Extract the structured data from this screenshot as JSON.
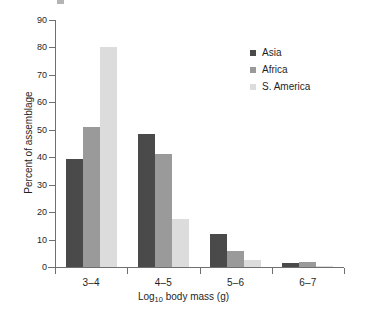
{
  "chart_data": {
    "type": "bar",
    "title": "",
    "subtitle": "",
    "xlabel_text": "Log10 body mass (g)",
    "xlabel_base": "Log",
    "xlabel_sub": "10",
    "xlabel_rest": " body mass (g)",
    "ylabel": "Percent of assemblage",
    "categories": [
      "3–4",
      "4–5",
      "5–6",
      "6–7"
    ],
    "series": [
      {
        "name": "Asia",
        "color": "#4a4a4a",
        "values": [
          39.5,
          48.5,
          12.0,
          1.5
        ]
      },
      {
        "name": "Africa",
        "color": "#9a9a9a",
        "values": [
          51.0,
          41.0,
          6.0,
          2.0
        ]
      },
      {
        "name": "S. America",
        "color": "#dcdcdc",
        "values": [
          80.0,
          17.5,
          2.5,
          0.3
        ]
      }
    ],
    "ylim": [
      0,
      90
    ],
    "ytick_step": 10,
    "yticks": [
      0,
      10,
      20,
      30,
      40,
      50,
      60,
      70,
      80,
      90
    ],
    "ytick_labels": [
      "0",
      "10",
      "20",
      "30",
      "40",
      "50",
      "60",
      "70",
      "80",
      "90"
    ],
    "grid": false,
    "legend_position": "top-right",
    "axis_color": "#6f6f6f",
    "text_color": "#1f1f1f",
    "background": "#ffffff"
  },
  "legend": {
    "entries": [
      {
        "label": "Asia",
        "color": "#4a4a4a"
      },
      {
        "label": "Africa",
        "color": "#9a9a9a"
      },
      {
        "label": "S. America",
        "color": "#dcdcdc"
      }
    ]
  }
}
